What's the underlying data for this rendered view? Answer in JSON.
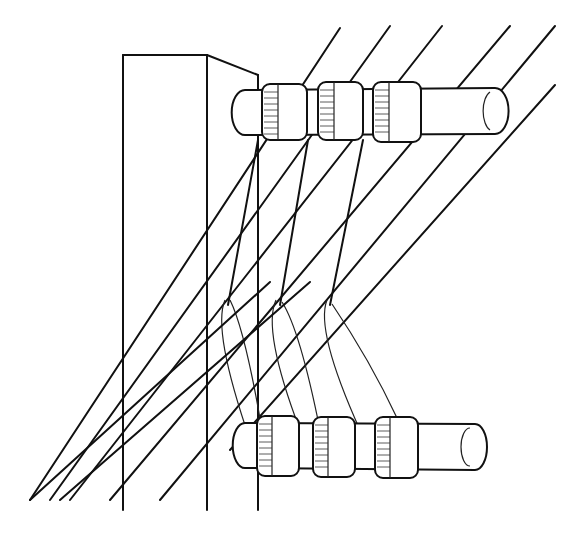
{
  "illustration": {
    "subject": "loom warp threads passing around spools on two horizontal rods mounted to an upright post",
    "colors": {
      "line": "#111111",
      "background": "#ffffff"
    },
    "post": {
      "label": "upright-post"
    },
    "rods": [
      {
        "name": "upper-rod",
        "spools": 3
      },
      {
        "name": "lower-rod",
        "spools": 3
      }
    ],
    "warp_threads": 7,
    "cross_threads": 3
  }
}
